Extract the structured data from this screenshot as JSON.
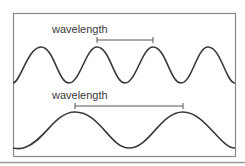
{
  "diagram": {
    "colors": {
      "background": "#ffffff",
      "frame": "#8a8a8a",
      "wave": "#3a3a3a",
      "bracket": "#555555",
      "footer_line": "#9a9a9a"
    },
    "panels": [
      {
        "id": "short-wave",
        "label": "wavelength",
        "description": "short wavelength wave (higher frequency)",
        "period_px": 56,
        "peaks_x": [
          41,
          97,
          153,
          208
        ],
        "bracket": {
          "x1": 97,
          "x2": 153,
          "y": 40
        }
      },
      {
        "id": "long-wave",
        "label": "wavelength",
        "description": "long wavelength wave (lower frequency)",
        "period_px": 108,
        "peaks_x": [
          75,
          183
        ],
        "bracket": {
          "x1": 75,
          "x2": 183,
          "y": 106
        }
      }
    ]
  }
}
